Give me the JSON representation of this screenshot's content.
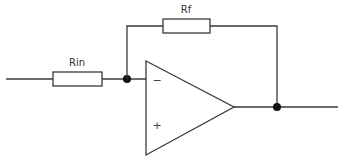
{
  "diagram": {
    "components": {
      "input_resistor": {
        "label": "Rin"
      },
      "feedback_resistor": {
        "label": "Rf"
      },
      "op_amp": {
        "inverting_input_symbol": "−",
        "non_inverting_input_symbol": "+"
      }
    },
    "colors": {
      "wire": "#3a3a3a",
      "node": "#111111",
      "background": "#ffffff"
    }
  }
}
